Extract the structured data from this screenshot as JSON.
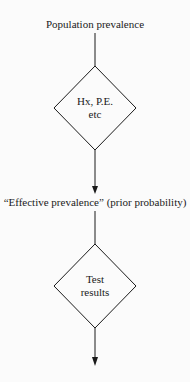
{
  "diagram": {
    "type": "flowchart",
    "nodes": [
      {
        "id": "population_prevalence",
        "kind": "label",
        "text": "Population prevalence"
      },
      {
        "id": "hx_pe",
        "kind": "decision",
        "lines": [
          "Hx, P.E.",
          "etc"
        ]
      },
      {
        "id": "effective_prevalence",
        "kind": "label",
        "text": "“Effective prevalence” (prior probability)"
      },
      {
        "id": "test_results",
        "kind": "decision",
        "lines": [
          "Test",
          "results"
        ]
      }
    ],
    "edges": [
      {
        "from": "population_prevalence",
        "to": "hx_pe",
        "arrow": false
      },
      {
        "from": "hx_pe",
        "to": "effective_prevalence",
        "arrow": true
      },
      {
        "from": "effective_prevalence",
        "to": "test_results",
        "arrow": false
      },
      {
        "from": "test_results",
        "to": "output",
        "arrow": true
      }
    ],
    "colors": {
      "line": "#1a1a1a",
      "background": "#fbfbfb"
    }
  }
}
